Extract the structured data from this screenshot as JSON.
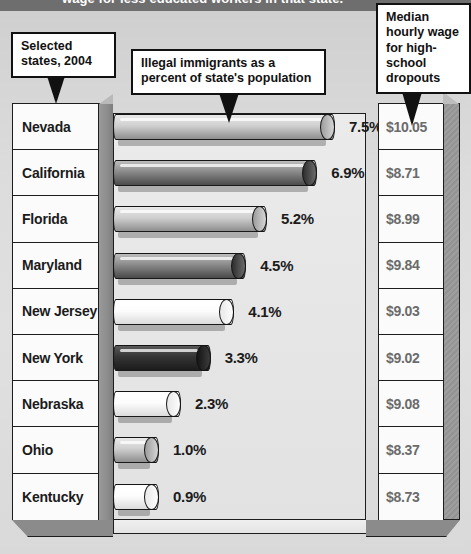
{
  "title_strip": {
    "text": "wage for less educated workers in that state."
  },
  "callouts": {
    "left": "Selected states, 2004",
    "center": "Illegal immigrants as a percent of state's population",
    "right": "Median hourly wage for high-school dropouts"
  },
  "columns": {
    "state": "State",
    "percent": "Illegal immigrants as a percent of state's population",
    "wage": "Median hourly wage for high-school dropouts"
  },
  "colors": {
    "bar_light": "#f2f2f2",
    "bar_mid": "#b4b4b4",
    "bar_dark": "#3a3a3a",
    "panel": "#fbfbfb",
    "outline": "#1d1d1d",
    "wage_text": "#6b6b6b",
    "title_bar": "#6e6e6e"
  },
  "chart_data": {
    "type": "bar",
    "title": "Illegal immigrants as a percent of state's population",
    "subtitle": "Selected states, 2004",
    "orientation": "horizontal",
    "xlabel": "",
    "ylabel": "",
    "xlim": [
      0,
      8
    ],
    "grid": false,
    "legend": "none",
    "categories": [
      "Nevada",
      "California",
      "Florida",
      "Maryland",
      "New Jersey",
      "New York",
      "Nebraska",
      "Ohio",
      "Kentucky"
    ],
    "values": [
      7.5,
      6.9,
      5.2,
      4.5,
      4.1,
      3.3,
      2.3,
      1.0,
      0.9
    ],
    "value_labels": [
      "7.5%",
      "6.9%",
      "5.2%",
      "4.5%",
      "4.1%",
      "3.3%",
      "2.3%",
      "1.0%",
      "0.9%"
    ],
    "series": [
      {
        "name": "Illegal immigrants as a percent of state's population",
        "values": [
          7.5,
          6.9,
          5.2,
          4.5,
          4.1,
          3.3,
          2.3,
          1.0,
          0.9
        ]
      },
      {
        "name": "Median hourly wage for high-school dropouts",
        "values": [
          10.05,
          8.71,
          8.99,
          9.84,
          9.03,
          9.02,
          9.08,
          8.37,
          8.73
        ]
      }
    ]
  },
  "rows": [
    {
      "state": "Nevada",
      "pct": "7.5%",
      "wage": "$10.05",
      "shade": "mid"
    },
    {
      "state": "California",
      "pct": "6.9%",
      "wage": "$8.71",
      "shade": "dark"
    },
    {
      "state": "Florida",
      "pct": "5.2%",
      "wage": "$8.99",
      "shade": "mid"
    },
    {
      "state": "Maryland",
      "pct": "4.5%",
      "wage": "$9.84",
      "shade": "dark"
    },
    {
      "state": "New Jersey",
      "pct": "4.1%",
      "wage": "$9.03",
      "shade": "light"
    },
    {
      "state": "New York",
      "pct": "3.3%",
      "wage": "$9.02",
      "shade": "vdark"
    },
    {
      "state": "Nebraska",
      "pct": "2.3%",
      "wage": "$9.08",
      "shade": "light"
    },
    {
      "state": "Ohio",
      "pct": "1.0%",
      "wage": "$8.37",
      "shade": "mid"
    },
    {
      "state": "Kentucky",
      "pct": "0.9%",
      "wage": "$8.73",
      "shade": "light"
    }
  ]
}
